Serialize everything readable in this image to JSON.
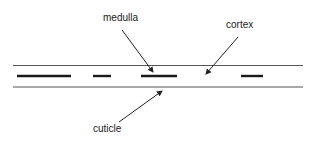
{
  "diagram": {
    "colors": {
      "background": "#ffffff",
      "outline": "#555555",
      "medulla": "#1a1a1a",
      "arrow": "#222222",
      "text": "#222222"
    },
    "shaft": {
      "x_start": 13,
      "x_end": 303,
      "top_y": 65.5,
      "bottom_y": 87
    },
    "medulla_segments": [
      {
        "x1": 17,
        "x2": 71,
        "y": 76
      },
      {
        "x1": 93,
        "x2": 111,
        "y": 76
      },
      {
        "x1": 141,
        "x2": 177,
        "y": 76
      },
      {
        "x1": 241,
        "x2": 263,
        "y": 76
      }
    ],
    "labels": [
      {
        "id": "medulla",
        "text": "medulla",
        "x": 103,
        "y": 13,
        "arrow": {
          "x1": 122,
          "y1": 30,
          "x2": 153,
          "y2": 72
        }
      },
      {
        "id": "cortex",
        "text": "cortex",
        "x": 226,
        "y": 20,
        "arrow": {
          "x1": 238,
          "y1": 37,
          "x2": 206,
          "y2": 74
        }
      },
      {
        "id": "cuticle",
        "text": "cuticle",
        "x": 93,
        "y": 124,
        "arrow": {
          "x1": 119,
          "y1": 122,
          "x2": 162,
          "y2": 91
        }
      }
    ]
  }
}
